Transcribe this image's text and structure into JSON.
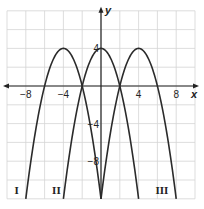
{
  "chart_data": {
    "type": "line",
    "title": "",
    "xlabel": "x",
    "ylabel": "y",
    "xlim": [
      -10,
      10
    ],
    "ylim": [
      -12,
      8
    ],
    "grid": true,
    "grid_step": 2,
    "x_ticks": [
      {
        "value": -8,
        "label": "−8"
      },
      {
        "value": -4,
        "label": "−4"
      },
      {
        "value": 4,
        "label": "4"
      },
      {
        "value": 8,
        "label": "8"
      }
    ],
    "y_ticks": [
      {
        "value": 4,
        "label": "4"
      },
      {
        "value": -4,
        "label": "−4"
      },
      {
        "value": -8,
        "label": "−8"
      }
    ],
    "series": [
      {
        "name": "I",
        "vertex": [
          -4,
          4
        ],
        "equation": "y = 4 - (x+4)^2",
        "x_range": [
          -8,
          0
        ],
        "label_pos": [
          -9.2,
          -11.5
        ]
      },
      {
        "name": "II",
        "vertex": [
          0,
          4
        ],
        "equation": "y = 4 - x^2",
        "x_range": [
          -4,
          4
        ],
        "label_pos": [
          -5.2,
          -11.5
        ]
      },
      {
        "name": "III",
        "vertex": [
          4,
          4
        ],
        "equation": "y = 4 - (x-4)^2",
        "x_range": [
          0,
          8
        ],
        "label_pos": [
          5.8,
          -11.5
        ]
      }
    ],
    "colors": {
      "curve": "#2b2b2b",
      "grid": "#d4d4d4",
      "axis": "#222222"
    }
  }
}
